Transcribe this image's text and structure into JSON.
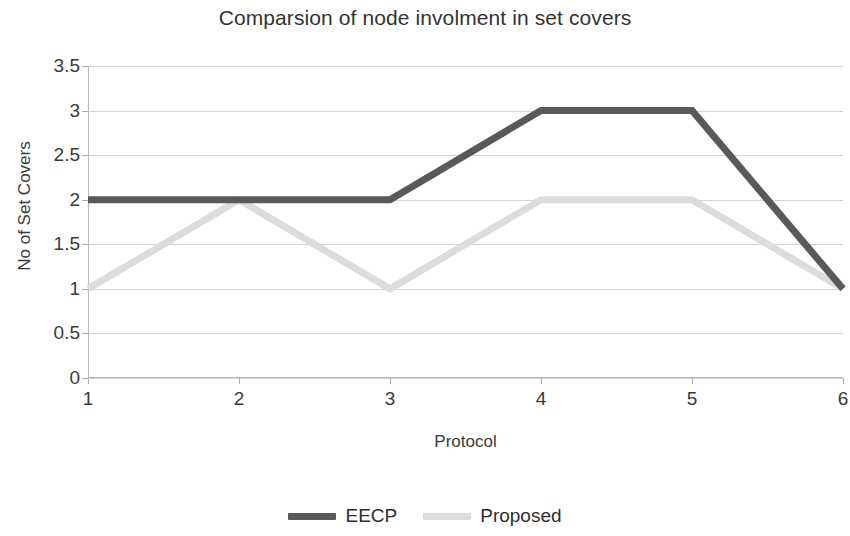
{
  "chart_data": {
    "type": "line",
    "title": "Comparsion of node involment in set covers",
    "xlabel": "Protocol",
    "ylabel": "No of Set Covers",
    "x": [
      1,
      2,
      3,
      4,
      5,
      6
    ],
    "xtick_labels": [
      "1",
      "2",
      "3",
      "4",
      "5",
      "6"
    ],
    "ytick_labels": [
      "0",
      "0.5",
      "1",
      "1.5",
      "2",
      "2.5",
      "3",
      "3.5"
    ],
    "ytick_values": [
      0,
      0.5,
      1,
      1.5,
      2,
      2.5,
      3,
      3.5
    ],
    "xlim": [
      1,
      6
    ],
    "ylim": [
      0,
      3.5
    ],
    "grid": "horizontal",
    "legend_position": "bottom-center",
    "series": [
      {
        "name": "EECP",
        "color": "#595959",
        "line_width": 7,
        "values": [
          2,
          2,
          2,
          3,
          3,
          1
        ]
      },
      {
        "name": "Proposed",
        "color": "#dcdcdc",
        "line_width": 7,
        "values": [
          1,
          2,
          1,
          2,
          2,
          1
        ]
      }
    ]
  },
  "legend": {
    "items": [
      {
        "label": "EECP",
        "color": "#595959"
      },
      {
        "label": "Proposed",
        "color": "#dcdcdc"
      }
    ]
  },
  "colors": {
    "background": "#ffffff",
    "gridline": "#d4d4d4",
    "axis": "#b8b8b8",
    "text": "#333333",
    "series_eecp": "#595959",
    "series_proposed": "#dcdcdc"
  }
}
